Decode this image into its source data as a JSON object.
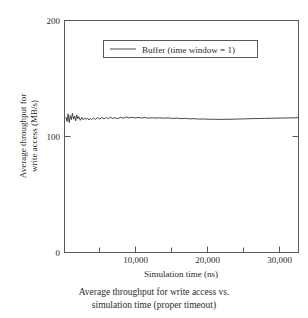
{
  "figure": {
    "caption_line1": "Average throughput for write access vs.",
    "caption_line2": "simulation time (proper timeout)"
  },
  "chart_data": {
    "type": "line",
    "title": "",
    "xlabel": "Simulation time (ns)",
    "ylabel_line1": "Average throughput for",
    "ylabel_line2": "write access (MB/s)",
    "ylabel": "Average throughput for write access (MB/s)",
    "xlim": [
      0,
      32500
    ],
    "ylim": [
      0,
      200
    ],
    "xticks": [
      10000,
      20000,
      30000
    ],
    "xtick_labels": [
      "10,000",
      "20,000",
      "30,000"
    ],
    "xticks_minor": [
      5000,
      15000,
      25000
    ],
    "yticks": [
      0,
      100,
      200
    ],
    "ytick_labels": [
      "0",
      "100",
      "200"
    ],
    "grid": false,
    "legend_position": "upper center",
    "line_color": "#333333",
    "frame_color": "#555555",
    "series": [
      {
        "name": "Buffer (time window = 1)",
        "x": [
          200,
          350,
          500,
          650,
          800,
          950,
          1100,
          1250,
          1400,
          1550,
          1700,
          1850,
          2000,
          2200,
          2400,
          2600,
          2800,
          3000,
          3200,
          3400,
          3600,
          3800,
          4000,
          4300,
          4600,
          4900,
          5200,
          5500,
          5800,
          6100,
          6400,
          6700,
          7000,
          7400,
          7800,
          8200,
          8600,
          9000,
          9400,
          9800,
          10200,
          10700,
          11200,
          11700,
          12200,
          12700,
          13200,
          13800,
          14400,
          15000,
          15600,
          16200,
          16800,
          17400,
          18000,
          18700,
          19400,
          20100,
          20800,
          21500,
          22200,
          23000,
          23800,
          24600,
          25400,
          26200,
          27000,
          27800,
          28600,
          29400,
          30200,
          31000,
          31800,
          32400
        ],
        "y": [
          116.5,
          113.0,
          119.5,
          112.0,
          118.0,
          114.5,
          120.0,
          115.0,
          117.5,
          113.5,
          118.5,
          115.5,
          117.0,
          114.0,
          116.5,
          114.5,
          116.0,
          114.8,
          115.8,
          114.2,
          115.5,
          114.6,
          115.9,
          114.8,
          116.2,
          115.0,
          116.4,
          115.2,
          116.3,
          115.4,
          116.6,
          115.6,
          116.2,
          115.4,
          116.5,
          115.8,
          116.8,
          116.0,
          116.6,
          115.9,
          116.4,
          116.0,
          116.3,
          115.8,
          116.2,
          115.9,
          116.1,
          115.8,
          116.0,
          115.6,
          115.8,
          115.4,
          115.6,
          115.2,
          115.4,
          115.0,
          115.1,
          114.8,
          114.9,
          114.7,
          114.9,
          114.8,
          115.0,
          115.1,
          115.3,
          115.4,
          115.5,
          115.6,
          115.7,
          115.8,
          115.9,
          116.0,
          116.1,
          116.2
        ]
      }
    ]
  },
  "legend": {
    "entries": [
      {
        "label": "Buffer (time window = 1)",
        "color": "#333333"
      }
    ]
  }
}
